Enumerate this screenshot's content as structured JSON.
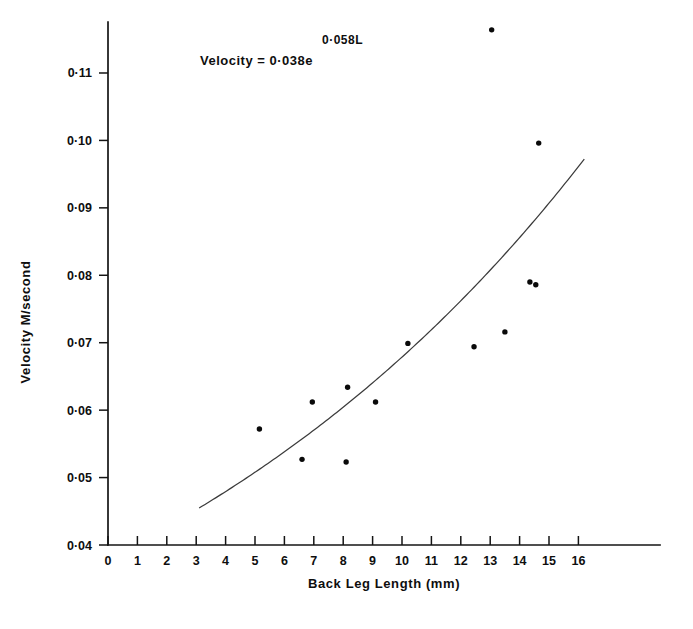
{
  "figure": {
    "background_color": "#ffffff",
    "ink_color": "#111111",
    "annotation": {
      "equation_main": "Velocity = 0·038e",
      "equation_exponent": "0·058L"
    },
    "caption_fragment": ""
  },
  "chart_data": {
    "type": "scatter",
    "title": "",
    "subtitle": "",
    "xlabel": "Back Leg Length (mm)",
    "ylabel": "Velocity M/second",
    "xlim": [
      0,
      16.6
    ],
    "ylim": [
      0.04,
      0.1155
    ],
    "grid": false,
    "legend": "none",
    "x_ticks": [
      0,
      1,
      2,
      3,
      4,
      5,
      6,
      7,
      8,
      9,
      10,
      11,
      12,
      13,
      14,
      15,
      16
    ],
    "x_tick_labels": [
      "0",
      "1",
      "2",
      "3",
      "4",
      "5",
      "6",
      "7",
      "8",
      "9",
      "10",
      "11",
      "12",
      "13",
      "14",
      "15",
      "16"
    ],
    "y_ticks": [
      0.04,
      0.05,
      0.06,
      0.07,
      0.08,
      0.09,
      0.1,
      0.11
    ],
    "y_tick_labels": [
      "0·04",
      "0·05",
      "0·06",
      "0·07",
      "0·08",
      "0·09",
      "0·10",
      "0·11"
    ],
    "x": [
      5.15,
      6.6,
      6.95,
      8.1,
      8.15,
      9.1,
      10.2,
      12.45,
      13.05,
      13.5,
      14.35,
      14.55,
      14.65
    ],
    "y": [
      0.0572,
      0.0527,
      0.0612,
      0.0523,
      0.0634,
      0.0612,
      0.0699,
      0.0694,
      0.1164,
      0.0716,
      0.079,
      0.0786,
      0.0996
    ],
    "points": [
      {
        "x": 5.15,
        "y": 0.0572
      },
      {
        "x": 6.6,
        "y": 0.0527
      },
      {
        "x": 6.95,
        "y": 0.0612
      },
      {
        "x": 8.1,
        "y": 0.0523
      },
      {
        "x": 8.15,
        "y": 0.0634
      },
      {
        "x": 9.1,
        "y": 0.0612
      },
      {
        "x": 10.2,
        "y": 0.0699
      },
      {
        "x": 12.45,
        "y": 0.0694
      },
      {
        "x": 13.05,
        "y": 0.1164
      },
      {
        "x": 13.5,
        "y": 0.0716
      },
      {
        "x": 14.35,
        "y": 0.079
      },
      {
        "x": 14.55,
        "y": 0.0786
      },
      {
        "x": 14.65,
        "y": 0.0996
      }
    ],
    "fit": {
      "label": "Velocity = 0·038e^(0·058L)",
      "equation_type": "exponential",
      "coefficient": 0.038,
      "exponent_rate": 0.058,
      "x_range": [
        3.1,
        16.2
      ]
    },
    "marker": {
      "shape": "circle",
      "size_px": 5.4,
      "color": "#0a0a0a"
    },
    "line": {
      "color": "#3b3b3b",
      "width_px": 1.25
    }
  }
}
